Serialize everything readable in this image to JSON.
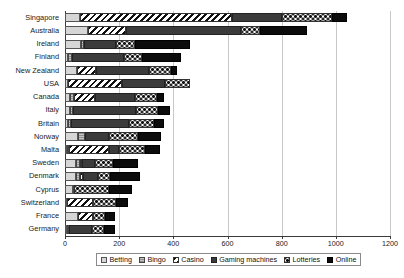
{
  "chart_data": {
    "type": "bar",
    "orientation": "horizontal",
    "stacked": true,
    "title": "",
    "xlabel": "",
    "ylabel": "",
    "xlim": [
      0,
      1200
    ],
    "xticks": [
      0,
      200,
      400,
      600,
      800,
      1000,
      1200
    ],
    "grid": true,
    "legend_position": "bottom",
    "categories": [
      "Singapore",
      "Australia",
      "Ireland",
      "Finland",
      "New Zealand",
      "USA",
      "Canada",
      "Italy",
      "Britain",
      "Norway",
      "Malta",
      "Sweden",
      "Denmark",
      "Cyprus",
      "Switzerland",
      "France",
      "Germany"
    ],
    "series": [
      {
        "name": "Betting",
        "pattern": "light-gray",
        "color": "#d6d6d6",
        "values": [
          55,
          85,
          60,
          12,
          45,
          10,
          18,
          18,
          12,
          48,
          8,
          40,
          42,
          28,
          8,
          48,
          6
        ]
      },
      {
        "name": "Bingo",
        "pattern": "horizontal-lines-gray",
        "color": "#8f8f8f",
        "values": [
          0,
          0,
          10,
          12,
          0,
          0,
          16,
          10,
          10,
          25,
          6,
          14,
          14,
          4,
          0,
          0,
          8
        ]
      },
      {
        "name": "Casino",
        "pattern": "diagonal-hatch",
        "color": "#111111",
        "values": [
          560,
          140,
          0,
          0,
          70,
          200,
          75,
          0,
          0,
          0,
          150,
          10,
          10,
          0,
          95,
          55,
          0
        ]
      },
      {
        "name": "Gaming machines",
        "pattern": "dark-gray-solid",
        "color": "#3b3b3b",
        "values": [
          185,
          425,
          120,
          195,
          195,
          160,
          150,
          235,
          215,
          90,
          35,
          45,
          55,
          0,
          0,
          0,
          85
        ]
      },
      {
        "name": "Lotteries",
        "pattern": "checker-dots",
        "color": "#ffffff",
        "values": [
          185,
          70,
          70,
          65,
          80,
          90,
          80,
          80,
          90,
          105,
          95,
          70,
          45,
          130,
          85,
          45,
          45
        ]
      },
      {
        "name": "Online",
        "pattern": "black-solid",
        "color": "#0c0c0c",
        "values": [
          55,
          175,
          200,
          145,
          25,
          0,
          25,
          45,
          40,
          85,
          55,
          90,
          110,
          85,
          45,
          35,
          40
        ]
      }
    ],
    "totals": [
      1040,
      895,
      460,
      429,
      415,
      460,
      364,
      388,
      367,
      353,
      349,
      269,
      276,
      247,
      233,
      183,
      184
    ]
  },
  "legend": {
    "items": [
      {
        "label": "Betting",
        "swatch": "betting-swatch"
      },
      {
        "label": "Bingo",
        "swatch": "bingo-swatch"
      },
      {
        "label": "Casino",
        "swatch": "casino-swatch"
      },
      {
        "label": "Gaming machines",
        "swatch": "gaming-machines-swatch"
      },
      {
        "label": "Lotteries",
        "swatch": "lotteries-swatch"
      },
      {
        "label": "Online",
        "swatch": "online-swatch"
      }
    ]
  }
}
